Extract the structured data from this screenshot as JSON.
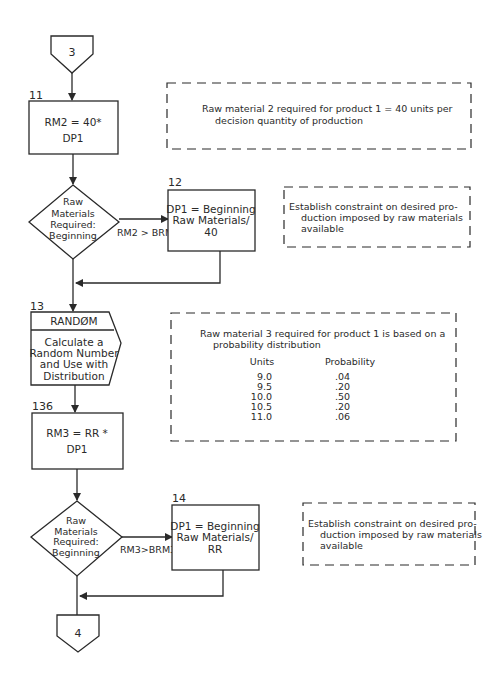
{
  "connectors": {
    "start": "3",
    "end": "4"
  },
  "steps": {
    "s11": {
      "number": "11",
      "lines": [
        "RM2 = 40*",
        "DP1"
      ]
    },
    "d1": {
      "lines": [
        "Raw",
        "Materials",
        "Required:",
        "Beginning"
      ],
      "condition": "RM2 > BRM2"
    },
    "s12": {
      "number": "12",
      "lines": [
        "DP1 = Beginning",
        "Raw Materials/",
        "40"
      ]
    },
    "s13": {
      "number": "13",
      "header": "RANDØM",
      "lines": [
        "Calculate a",
        "Random Number",
        "and Use with",
        "Distribution"
      ]
    },
    "s136": {
      "number": "136",
      "lines": [
        "RM3 = RR *",
        "DP1"
      ]
    },
    "d2": {
      "lines": [
        "Raw",
        "Materials",
        "Required:",
        "Beginning"
      ],
      "condition": "RM3>BRM3"
    },
    "s14": {
      "number": "14",
      "lines": [
        "DP1 = Beginning",
        "Raw Materials/",
        "RR"
      ]
    }
  },
  "notes": {
    "n1": {
      "lines": [
        "Raw material 2 required for product 1 = 40 units per",
        "decision quantity of production"
      ]
    },
    "n2": {
      "lines": [
        "Establish constraint on desired pro-",
        "duction imposed by raw materials",
        "available"
      ]
    },
    "n3": {
      "lines": [
        "Raw material 3 required for product 1 is based on a",
        "probability distribution"
      ],
      "table": {
        "headers": [
          "Units",
          "Probability"
        ],
        "rows": [
          [
            "9.0",
            ".04"
          ],
          [
            "9.5",
            ".20"
          ],
          [
            "10.0",
            ".50"
          ],
          [
            "10.5",
            ".20"
          ],
          [
            "11.0",
            ".06"
          ]
        ]
      }
    },
    "n4": {
      "lines": [
        "Establish constraint on desired pro-",
        "duction imposed by raw materials",
        "available"
      ]
    }
  }
}
